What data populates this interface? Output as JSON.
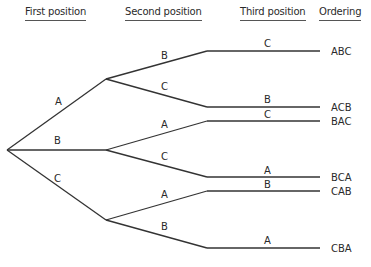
{
  "headers": {
    "first": "First position",
    "second": "Second position",
    "third": "Third position",
    "ordering": "Ordering"
  },
  "tree": {
    "root": "start",
    "level1": [
      {
        "label": "A",
        "children": [
          {
            "label": "B",
            "children": [
              {
                "label": "C",
                "ordering": "ABC"
              }
            ]
          },
          {
            "label": "C",
            "children": [
              {
                "label": "B",
                "ordering": "ACB"
              }
            ]
          }
        ]
      },
      {
        "label": "B",
        "children": [
          {
            "label": "A",
            "children": [
              {
                "label": "C",
                "ordering": "BAC"
              }
            ]
          },
          {
            "label": "C",
            "children": [
              {
                "label": "A",
                "ordering": "BCA"
              }
            ]
          }
        ]
      },
      {
        "label": "C",
        "children": [
          {
            "label": "A",
            "children": [
              {
                "label": "B",
                "ordering": "CAB"
              }
            ]
          },
          {
            "label": "B",
            "children": [
              {
                "label": "A",
                "ordering": "CBA"
              }
            ]
          }
        ]
      }
    ]
  },
  "edge_labels": {
    "l1": [
      "A",
      "B",
      "C"
    ],
    "l2": [
      "B",
      "C",
      "A",
      "C",
      "A",
      "B"
    ],
    "l3": [
      "C",
      "B",
      "C",
      "A",
      "B",
      "A"
    ]
  },
  "orderings": [
    "ABC",
    "ACB",
    "BAC",
    "BCA",
    "CAB",
    "CBA"
  ]
}
